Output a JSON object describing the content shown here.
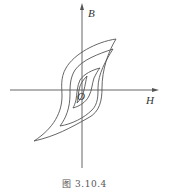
{
  "figure": {
    "caption": "图 3.10.4",
    "axes": {
      "vertical_label": "B",
      "horizontal_label": "H",
      "origin_label": "O"
    },
    "loops": [
      {
        "name": "outer-loop",
        "description": "largest hysteresis loop"
      },
      {
        "name": "second-loop",
        "description": "second hysteresis loop"
      },
      {
        "name": "third-loop",
        "description": "third hysteresis loop"
      },
      {
        "name": "inner-loop",
        "description": "smallest hysteresis loop"
      }
    ],
    "colors": {
      "line": "#555555",
      "background": "#ffffff"
    }
  }
}
